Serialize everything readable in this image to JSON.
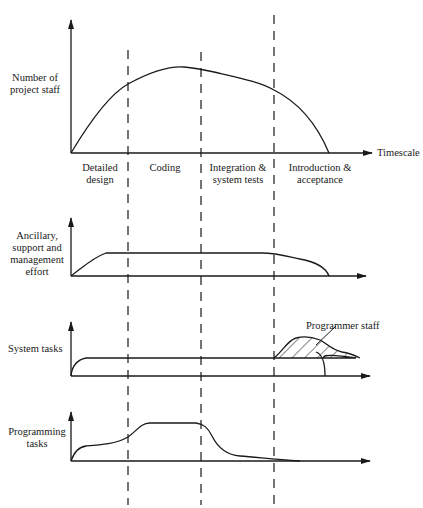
{
  "figure": {
    "cut_text_fragment": "…development phases and staffing (caption cut off at top)…",
    "x_axis_label": "Timescale",
    "phases": [
      {
        "label_line1": "Detailed",
        "label_line2": "design"
      },
      {
        "label_line1": "Coding",
        "label_line2": ""
      },
      {
        "label_line1": "Integration &",
        "label_line2": "system tests"
      },
      {
        "label_line1": "Introduction &",
        "label_line2": "acceptance"
      }
    ],
    "panels": [
      {
        "name": "project-staff",
        "label_lines": [
          "Number of",
          "project staff"
        ]
      },
      {
        "name": "ancillary",
        "label_lines": [
          "Ancillary,",
          "support and",
          "management",
          "effort"
        ]
      },
      {
        "name": "system-tasks",
        "label_lines": [
          "System tasks"
        ],
        "annotation": "Programmer staff"
      },
      {
        "name": "programming-tasks",
        "label_lines": [
          "Programming",
          "tasks"
        ]
      }
    ],
    "colors": {
      "ink": "#1a1a1a",
      "background": "#ffffff"
    }
  }
}
